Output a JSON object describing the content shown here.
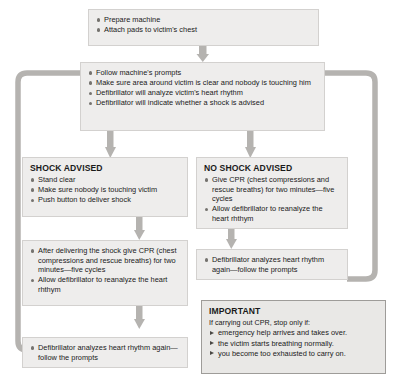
{
  "diagram": {
    "colors": {
      "box_fill": "#eeedec",
      "box_border": "#d3d1cf",
      "connector": "#b5b3b0",
      "bullet": "#75736f",
      "important_border": "#9e9c99",
      "text": "#1a1a1a"
    }
  },
  "nodes": {
    "prepare": {
      "name": "prepare-machine-box",
      "items": [
        "Prepare machine",
        "Attach pads to victim's chest"
      ]
    },
    "prompts": {
      "name": "follow-prompts-box",
      "items": [
        "Follow machine's prompts",
        "Make sure area around victim is clear and nobody is touching him",
        "Defibrillator will analyze victim's heart rhythm",
        "Defibrillator will indicate whether a shock is advised"
      ]
    },
    "shock_advised": {
      "name": "shock-advised-box",
      "heading": "SHOCK ADVISED",
      "items": [
        "Stand clear",
        "Make sure nobody is touching victim",
        "Push button to deliver shock"
      ]
    },
    "no_shock_advised": {
      "name": "no-shock-advised-box",
      "heading": "NO SHOCK ADVISED",
      "items": [
        "Give CPR (chest compressions and rescue breaths) for two minutes—five cycles",
        "Allow defibrillator to reanalyze the heart rhthym"
      ]
    },
    "after_shock": {
      "name": "after-shock-cpr-box",
      "items": [
        "After delivering the shock give CPR (chest compressions and rescue breaths) for two minutes—five cycles",
        "Allow defibrillator to reanalyze the heart rhthym"
      ]
    },
    "reanalyze_right": {
      "name": "reanalyze-right-box",
      "items": [
        "Defibrillator analyzes heart rhythm again—follow the prompts"
      ]
    },
    "reanalyze_left": {
      "name": "reanalyze-left-box",
      "items": [
        "Defibrillator analyzes heart rhythm again—follow the prompts"
      ]
    },
    "important": {
      "name": "important-note-box",
      "heading": "IMPORTANT",
      "subtitle": "If carrying out CPR, stop only if:",
      "items": [
        "emergency help arrives and takes over.",
        "the victim starts breathing normally.",
        "you become too exhausted to carry on."
      ]
    }
  }
}
